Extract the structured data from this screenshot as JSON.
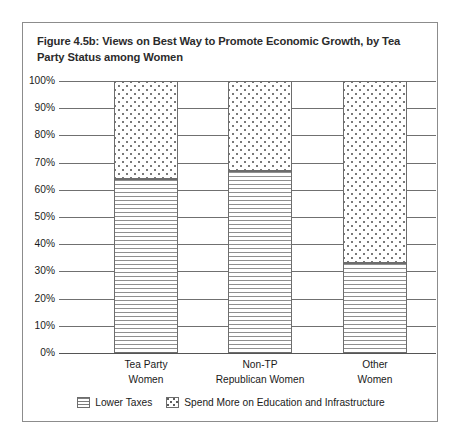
{
  "figure": {
    "title": "Figure 4.5b: Views on Best Way to Promote Economic Growth, by Tea Party Status among Women"
  },
  "chart_data": {
    "type": "bar",
    "stacked": true,
    "stacked_mode": "percent",
    "title": "Figure 4.5b: Views on Best Way to Promote Economic Growth, by Tea Party Status among Women",
    "xlabel": "",
    "ylabel": "",
    "ylim": [
      0,
      100
    ],
    "grid": true,
    "legend_position": "bottom",
    "categories": [
      "Tea Party Women",
      "Non-TP Republican Women",
      "Other Women"
    ],
    "category_lines": [
      [
        "Tea Party",
        "Women"
      ],
      [
        "Non-TP",
        "Republican Women"
      ],
      [
        "Other",
        "Women"
      ]
    ],
    "ytick_labels": [
      "100%",
      "90%",
      "80%",
      "70%",
      "60%",
      "50%",
      "40%",
      "30%",
      "20%",
      "10%",
      "0%"
    ],
    "ytick_values": [
      100,
      90,
      80,
      70,
      60,
      50,
      40,
      30,
      20,
      10,
      0
    ],
    "series": [
      {
        "name": "Lower Taxes",
        "pattern": "horizontal-lines",
        "values": [
          64,
          67,
          33
        ]
      },
      {
        "name": "Spend More on Education and Infrastructure",
        "pattern": "dots",
        "values": [
          36,
          33,
          67
        ]
      }
    ]
  },
  "legend": {
    "items": [
      {
        "label": "Lower Taxes",
        "pattern": "horizontal-lines"
      },
      {
        "label": "Spend More on Education and Infrastructure",
        "pattern": "dots"
      }
    ]
  },
  "colors": {
    "frame": "#8c8c8c",
    "gridline": "#707070",
    "bar_outline": "#6d6d6d",
    "background": "#ffffff",
    "text": "#1a1a1a"
  }
}
